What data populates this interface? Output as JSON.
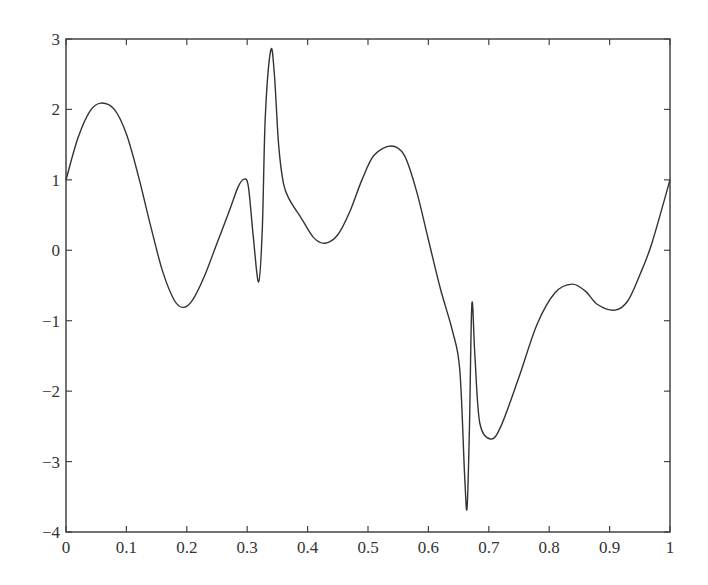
{
  "chart_data": {
    "type": "line",
    "title": "",
    "xlabel": "",
    "ylabel": "",
    "xlim": [
      0,
      1
    ],
    "ylim": [
      -4,
      3
    ],
    "grid": false,
    "legend": null,
    "x_ticks": [
      "0",
      "0.1",
      "0.2",
      "0.3",
      "0.4",
      "0.5",
      "0.6",
      "0.7",
      "0.8",
      "0.9",
      "1"
    ],
    "x_tick_values": [
      0,
      0.1,
      0.2,
      0.3,
      0.4,
      0.5,
      0.6,
      0.7,
      0.8,
      0.9,
      1.0
    ],
    "y_ticks": [
      "3",
      "2",
      "1",
      "0",
      "−1",
      "−2",
      "−3",
      "−4"
    ],
    "y_tick_values": [
      3,
      2,
      1,
      0,
      -1,
      -2,
      -3,
      -4
    ],
    "series": [
      {
        "name": "f(x)",
        "color": "#333333",
        "x": [
          0,
          0.02,
          0.04,
          0.058,
          0.08,
          0.1,
          0.12,
          0.14,
          0.16,
          0.18,
          0.195,
          0.21,
          0.23,
          0.25,
          0.27,
          0.285,
          0.295,
          0.302,
          0.31,
          0.319,
          0.325,
          0.33,
          0.339,
          0.345,
          0.352,
          0.36,
          0.37,
          0.39,
          0.41,
          0.429,
          0.45,
          0.47,
          0.49,
          0.51,
          0.538,
          0.56,
          0.58,
          0.6,
          0.62,
          0.64,
          0.652,
          0.66,
          0.664,
          0.668,
          0.672,
          0.677,
          0.685,
          0.703,
          0.72,
          0.75,
          0.78,
          0.81,
          0.838,
          0.86,
          0.88,
          0.909,
          0.93,
          0.95,
          0.97,
          1.0
        ],
        "y": [
          1.0,
          1.6,
          1.98,
          2.09,
          2.0,
          1.65,
          1.05,
          0.35,
          -0.3,
          -0.72,
          -0.81,
          -0.7,
          -0.35,
          0.1,
          0.55,
          0.9,
          1.01,
          0.9,
          0.2,
          -0.45,
          0.3,
          1.9,
          2.84,
          2.5,
          1.5,
          0.95,
          0.72,
          0.45,
          0.18,
          0.1,
          0.22,
          0.55,
          1.0,
          1.35,
          1.48,
          1.35,
          0.85,
          0.15,
          -0.55,
          -1.15,
          -1.7,
          -3.2,
          -3.66,
          -2.5,
          -0.76,
          -1.5,
          -2.45,
          -2.68,
          -2.5,
          -1.8,
          -1.05,
          -0.6,
          -0.48,
          -0.58,
          -0.77,
          -0.85,
          -0.72,
          -0.35,
          0.1,
          1.0
        ]
      }
    ]
  }
}
